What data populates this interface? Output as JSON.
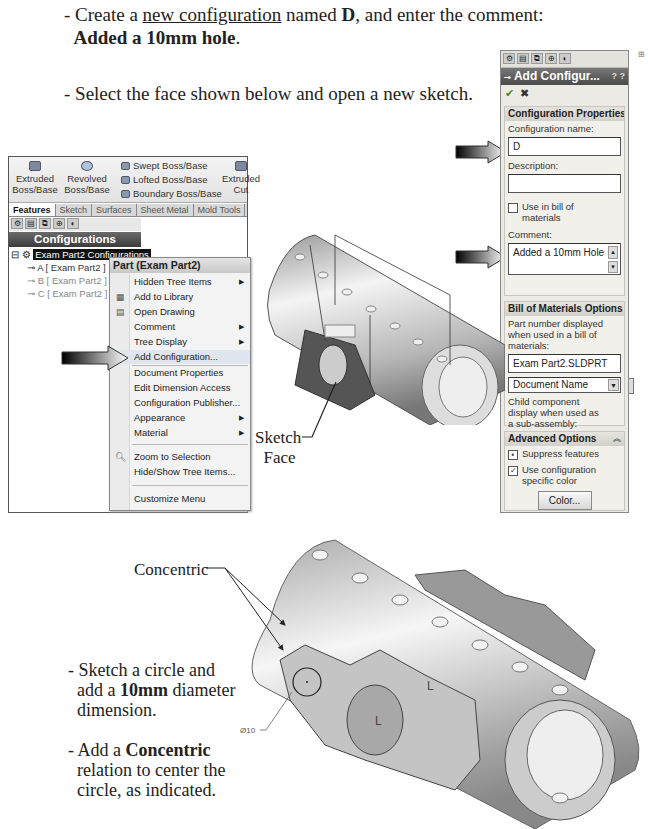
{
  "instructions": {
    "step1_prefix": "- Create a ",
    "step1_link": "new configuration",
    "step1_mid": " named ",
    "step1_name": "D",
    "step1_suffix": ", and enter the comment:",
    "step1_comment": "Added a 10mm hole",
    "step1_period": ".",
    "step2": "- Select the face shown below and open a new sketch.",
    "step3_line1": "- Sketch a circle and",
    "step3_line2_prefix": "add a ",
    "step3_line2_bold": "10mm",
    "step3_line2_suffix": " diameter",
    "step3_line3": "dimension.",
    "step4_line1_prefix": "- Add a ",
    "step4_line1_bold": "Concentric",
    "step4_line2": "relation to center the",
    "step4_line3": "circle, as indicated."
  },
  "callouts": {
    "sketch_face_line1": "Sketch",
    "sketch_face_line2": "Face",
    "concentric": "Concentric",
    "dimension": "Ø10"
  },
  "command_manager": {
    "tools": [
      {
        "label_line1": "Extruded",
        "label_line2": "Boss/Base",
        "icon": "extruded-boss-icon"
      },
      {
        "label_line1": "Revolved",
        "label_line2": "Boss/Base",
        "icon": "revolved-boss-icon"
      },
      {
        "label_line1": "Extruded",
        "label_line2": "Cut",
        "icon": "extruded-cut-icon"
      }
    ],
    "small_tools": [
      {
        "label": "Swept Boss/Base",
        "icon": "swept-boss-icon"
      },
      {
        "label": "Lofted Boss/Base",
        "icon": "lofted-boss-icon"
      },
      {
        "label": "Boundary Boss/Base",
        "icon": "boundary-boss-icon"
      }
    ],
    "tabs": [
      "Features",
      "Sketch",
      "Surfaces",
      "Sheet Metal",
      "Mold Tools"
    ],
    "active_tab": "Features"
  },
  "configuration_manager": {
    "header": "Configurations",
    "root": "Exam Part2 Configurations",
    "children": [
      "A [ Exam Part2 ]",
      "B [ Exam Part2 ]",
      "C [ Exam Part2 ]"
    ]
  },
  "context_menu": {
    "title": "Part (Exam Part2)",
    "items": [
      {
        "label": "Hidden Tree Items",
        "submenu": true
      },
      {
        "label": "Add to Library",
        "icon": "library-icon"
      },
      {
        "label": "Open Drawing",
        "icon": "drawing-icon"
      },
      {
        "label": "Comment",
        "submenu": true
      },
      {
        "label": "Tree Display",
        "submenu": true
      },
      {
        "label": "Add Configuration...",
        "icon": "add-configuration-icon",
        "highlighted": true
      },
      {
        "label": "Document Properties"
      },
      {
        "label": "Edit Dimension Access"
      },
      {
        "label": "Configuration Publisher..."
      },
      {
        "label": "Appearance",
        "submenu": true
      },
      {
        "label": "Material",
        "submenu": true
      },
      {
        "label": "Zoom to Selection",
        "icon": "zoom-icon"
      },
      {
        "label": "Hide/Show Tree Items..."
      },
      {
        "label": "Customize Menu"
      }
    ]
  },
  "property_manager": {
    "title": "Add Configur...",
    "help": "? ?",
    "ok": "✔",
    "cancel": "✖",
    "config_properties": {
      "header": "Configuration Properties",
      "name_label": "Configuration name:",
      "name_value": "D",
      "description_label": "Description:",
      "description_value": "",
      "use_in_bom_label": "Use in bill of materials",
      "use_in_bom_checked": false,
      "comment_label": "Comment:",
      "comment_value": "Added a 10mm Hole"
    },
    "bom_options": {
      "header": "Bill of Materials Options",
      "part_number_label": "Part number displayed when used in a bill of materials:",
      "part_number_value": "Exam Part2.SLDPRT",
      "dropdown_value": "Document Name",
      "child_label": "Child component display when used as a sub-assembly:"
    },
    "advanced_options": {
      "header": "Advanced Options",
      "suppress_features_label": "Suppress features",
      "suppress_features_checked": true,
      "use_color_label": "Use configuration specific color",
      "use_color_checked": true,
      "color_button": "Color..."
    }
  },
  "colors": {
    "title_bar_dark": "#4a4a4a",
    "panel_bg": "#eceae4",
    "menu_bg": "#f3f3f3",
    "model_gray": "#b8b8b8"
  }
}
